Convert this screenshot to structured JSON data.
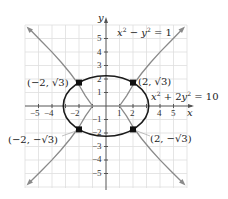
{
  "figure": {
    "axis_labels": {
      "x": "x",
      "y": "y"
    },
    "equations": {
      "hyperbola": {
        "lhs_a": "x",
        "exp_a": "2",
        "minus": " − ",
        "lhs_b": "y",
        "exp_b": "2",
        "rhs": " = 1"
      },
      "ellipse": {
        "lhs_a": "x",
        "exp_a": "2",
        "plus": " + 2",
        "lhs_b": "y",
        "exp_b": "2",
        "rhs": " = 10"
      }
    },
    "points": [
      {
        "label": "(−2, √3)",
        "x": -2,
        "y": 1.732
      },
      {
        "label": "(2, √3)",
        "x": 2,
        "y": 1.732
      },
      {
        "label": "(−2, −√3)",
        "x": -2,
        "y": -1.732
      },
      {
        "label": "(2, −√3)",
        "x": 2,
        "y": -1.732
      }
    ],
    "x_ticks": [
      "−5",
      "−4",
      "−2",
      "1",
      "2",
      "4",
      "5"
    ],
    "y_ticks": [
      "5",
      "4",
      "3",
      "2",
      "1",
      "−1",
      "−2",
      "−3",
      "−4",
      "−5"
    ],
    "colors": {
      "ellipse": "#1a1a1a",
      "hyperbola": "#8a8a8a",
      "grid": "#dcdcdc",
      "axis": "#555555",
      "point": "#111111"
    }
  }
}
